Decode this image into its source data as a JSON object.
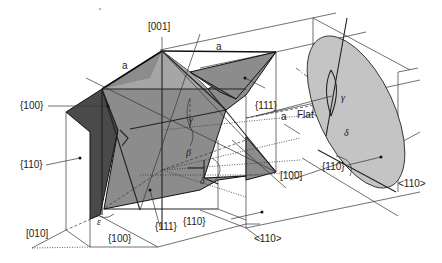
{
  "diagram": {
    "labels": {
      "dir_001": "[001]",
      "dir_010": "[010]",
      "dir_100": "[100]",
      "dir_110_bottom": "<110>",
      "dir_110_right": "<110>",
      "face_100_left": "{100}",
      "face_100_bottom": "{100}",
      "face_110_left": "{110}",
      "face_110_bottom": "{110}",
      "face_110_wafer": "{110}",
      "face_111_top": "{111}",
      "face_111_front": "{111}",
      "edge_a_left": "a",
      "edge_a_top": "a",
      "edge_a_right": "a",
      "flat": "Flat",
      "angle_beta": "β",
      "angle_gamma_center": "γ",
      "angle_gamma_wafer": "γ",
      "angle_delta_center": "δ",
      "angle_delta_wafer": "δ",
      "angle_epsilon": "ε"
    },
    "colors": {
      "dark_face": "#4a4a4a",
      "mid_face": "#8c8c8c",
      "light_face": "#a6a6a6",
      "wafer": "#c4c4c4",
      "line": "#222222",
      "background": "#ffffff"
    }
  }
}
